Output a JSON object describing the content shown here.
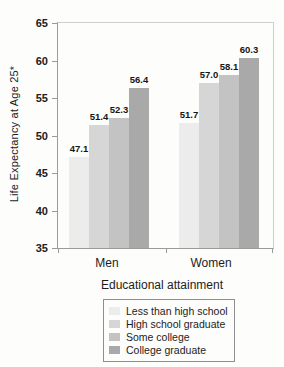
{
  "chart_data": {
    "type": "bar",
    "title": "",
    "ylabel": "Life Expectancy at Age 25*",
    "xlabel": "Educational attainment",
    "categories": [
      "Men",
      "Women"
    ],
    "series": [
      {
        "name": "Less than high school",
        "color": "#ececec",
        "values": [
          47.1,
          51.7
        ]
      },
      {
        "name": "High school graduate",
        "color": "#d6d6d6",
        "values": [
          51.4,
          57.0
        ]
      },
      {
        "name": "Some college",
        "color": "#c3c3c3",
        "values": [
          52.3,
          58.1
        ]
      },
      {
        "name": "College graduate",
        "color": "#a9a9a9",
        "values": [
          56.4,
          60.3
        ]
      }
    ],
    "ylim": [
      35,
      65
    ],
    "ytick_step": 5,
    "value_labels": true,
    "value_label_format": "0.0",
    "grid": false,
    "legend_position": "bottom",
    "axis_color": "#9b9b9b",
    "frame_color": "#cfcfcf"
  }
}
